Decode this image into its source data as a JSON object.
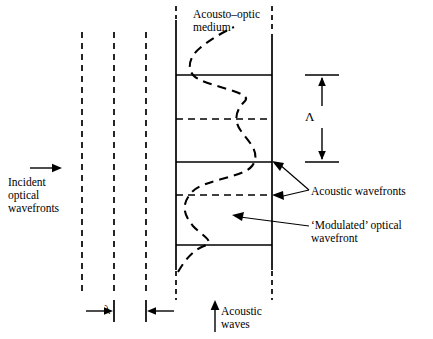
{
  "figure": {
    "type": "acousto-optic-modulation-diagram",
    "labels": {
      "medium": "Acousto–optic\nmedium",
      "incident": "Incident\noptical\nwavefronts",
      "acoustic_wavefronts": "Acoustic wavefronts",
      "modulated_wavefront": "‘Modulated’ optical\nwavefront",
      "acoustic_waves": "Acoustic\nwaves",
      "optical_wavelength_symbol": "λ",
      "acoustic_wavelength_symbol": "Λ"
    },
    "colors": {
      "ink": "#000000",
      "background": "#ffffff"
    },
    "geometry": {
      "optical_wavefronts_x": [
        82,
        114,
        146
      ],
      "medium_box": {
        "left": 176,
        "right": 272,
        "top": 20,
        "bottom": 270
      },
      "acoustic_wavefront_solid_y": [
        75,
        162,
        245
      ],
      "acoustic_wavefront_dashed_y": [
        119,
        195
      ],
      "acoustic_period_marker": {
        "x": 322,
        "top": 75,
        "bottom": 162
      },
      "optical_period_marker": {
        "y": 311,
        "left": 114,
        "right": 146
      }
    }
  }
}
